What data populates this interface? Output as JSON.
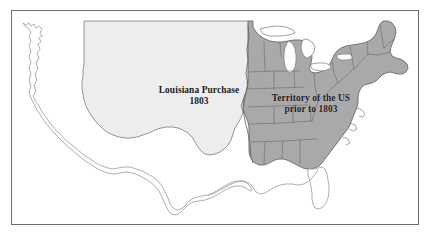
{
  "figure": {
    "kind": "historical-map",
    "background_color": "#ffffff",
    "frame_color": "#6d6d6d"
  },
  "map": {
    "regions": [
      {
        "id": "louisiana-purchase",
        "name": "Louisiana Purchase",
        "label_line_1": "Louisiana Purchase",
        "label_line_2": "1803",
        "fill_color": "#ededed",
        "outline_color": "#8a8a8a"
      },
      {
        "id": "us-prior-1803",
        "name": "Territory of the US prior to 1803",
        "label_line_1": "Territory of the US",
        "label_line_2": "prior to 1803",
        "fill_color": "#a9a9a9",
        "outline_color": "#6a6a6a"
      },
      {
        "id": "unclaimed-outline",
        "name": "Remaining modern US outline",
        "label_line_1": "",
        "label_line_2": "",
        "fill_color": "#ffffff",
        "outline_color": "#9a9a9a"
      }
    ],
    "water_bodies": [
      {
        "id": "great-lakes",
        "name": "Great Lakes",
        "fill_color": "#ffffff"
      }
    ],
    "labels": [
      {
        "id": "louisiana-purchase-label",
        "line_1": "Louisiana Purchase",
        "line_2": "1803",
        "color": "#1a1a1a"
      },
      {
        "id": "territory-label",
        "line_1": "Territory of the US",
        "line_2": "prior to 1803",
        "color": "#1a1a1a"
      }
    ]
  }
}
